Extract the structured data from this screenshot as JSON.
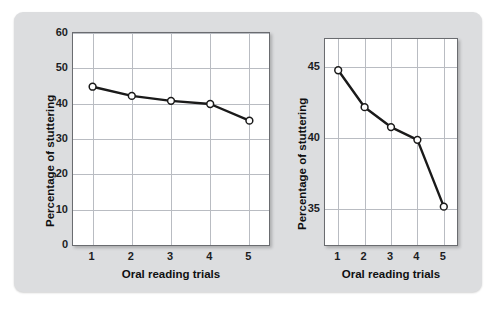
{
  "figure": {
    "background_color": "#dcdddf",
    "plot_background_color": "#ffffff",
    "grid_color": "#b9bcc2",
    "line_color": "#1a1a1a",
    "marker_fill": "#ffffff"
  },
  "chart_data": [
    {
      "type": "line",
      "id": "left-chart",
      "title": "",
      "xlabel": "Oral reading trials",
      "ylabel": "Percentage of stuttering",
      "categories": [
        "1",
        "2",
        "3",
        "4",
        "5"
      ],
      "x": [
        1,
        2,
        3,
        4,
        5
      ],
      "values": [
        44.8,
        42.2,
        40.8,
        39.9,
        35.2
      ],
      "xlim": [
        0.5,
        5.5
      ],
      "ylim": [
        0,
        60
      ],
      "yticks": [
        0,
        10,
        20,
        30,
        40,
        50,
        60
      ],
      "ytick_labels": [
        "0",
        "10",
        "20",
        "30",
        "40",
        "50",
        "60"
      ],
      "xticks": [
        1,
        2,
        3,
        4,
        5
      ],
      "xtick_labels": [
        "1",
        "2",
        "3",
        "4",
        "5"
      ],
      "grid": true,
      "legend": "none",
      "marker": "open-circle"
    },
    {
      "type": "line",
      "id": "right-chart",
      "title": "",
      "xlabel": "Oral reading trials",
      "ylabel": "Percentage of stuttering",
      "categories": [
        "1",
        "2",
        "3",
        "4",
        "5"
      ],
      "x": [
        1,
        2,
        3,
        4,
        5
      ],
      "values": [
        44.8,
        42.2,
        40.8,
        39.9,
        35.2
      ],
      "xlim": [
        0.5,
        5.5
      ],
      "ylim": [
        32.5,
        47.0
      ],
      "yticks": [
        35,
        40,
        45
      ],
      "ytick_labels": [
        "35",
        "40",
        "45"
      ],
      "xticks": [
        1,
        2,
        3,
        4,
        5
      ],
      "xtick_labels": [
        "1",
        "2",
        "3",
        "4",
        "5"
      ],
      "grid": true,
      "legend": "none",
      "marker": "open-circle"
    }
  ],
  "left": {
    "ylabel": "Percentage of stuttering",
    "xlabel": "Oral reading trials",
    "yticks": [
      "60",
      "50",
      "40",
      "30",
      "20",
      "10",
      "0"
    ],
    "xticks": [
      "1",
      "2",
      "3",
      "4",
      "5"
    ]
  },
  "right": {
    "ylabel": "Percentage of stuttering",
    "xlabel": "Oral reading trials",
    "yticks": [
      "45",
      "40",
      "35"
    ],
    "xticks": [
      "1",
      "2",
      "3",
      "4",
      "5"
    ]
  }
}
